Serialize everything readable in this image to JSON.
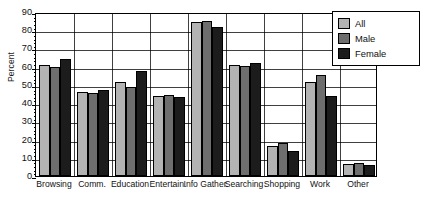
{
  "chart_data": {
    "type": "bar",
    "title": "",
    "subtitle": "",
    "xlabel": "",
    "ylabel": "Percent",
    "ylim": [
      0,
      90
    ],
    "ytick_step": 10,
    "yticks": [
      0,
      10,
      20,
      30,
      40,
      50,
      60,
      70,
      80,
      90
    ],
    "ytick_labels": [
      "0",
      "10",
      "20",
      "30",
      "40",
      "50",
      "60",
      "70",
      "80",
      "90"
    ],
    "minor_tick_step": 2,
    "grid": "horizontal-and-group-separators",
    "legend_position": "top-right",
    "categories": [
      "Browsing",
      "Comm.",
      "Education",
      "Entertain.",
      "Info Gather.",
      "Searching",
      "Shopping",
      "Work",
      "Other"
    ],
    "series": [
      {
        "name": "All",
        "color": "#b3b3b3",
        "values": [
          61,
          46,
          51.5,
          44,
          84.5,
          61,
          16.5,
          51.5,
          6.5
        ]
      },
      {
        "name": "Male",
        "color": "#6e6e6e",
        "values": [
          60,
          45.5,
          49,
          44.5,
          85,
          60.5,
          18,
          55.5,
          7
        ]
      },
      {
        "name": "Female",
        "color": "#1c1c1c",
        "values": [
          64,
          47,
          57.5,
          43.5,
          82,
          62,
          13.5,
          44,
          6
        ]
      }
    ]
  },
  "legend": {
    "entries": [
      {
        "label": "All"
      },
      {
        "label": "Male"
      },
      {
        "label": "Female"
      }
    ]
  }
}
